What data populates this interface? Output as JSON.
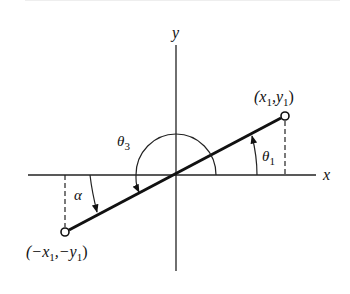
{
  "diagram": {
    "title": "",
    "axes": {
      "x_label": "x",
      "y_label": "y"
    },
    "points": {
      "p1": {
        "label": "(x",
        "sub1": "1",
        "mid": ",y",
        "sub2": "1",
        "end": ")"
      },
      "p2": {
        "label": "(−x",
        "sub1": "1",
        "mid": ",−y",
        "sub2": "1",
        "end": ")"
      }
    },
    "angles": {
      "theta1": {
        "symbol": "θ",
        "sub": "1"
      },
      "theta3": {
        "symbol": "θ",
        "sub": "3"
      },
      "alpha": {
        "symbol": "α"
      }
    },
    "colors": {
      "line": "#111111",
      "background": "#ffffff"
    }
  }
}
